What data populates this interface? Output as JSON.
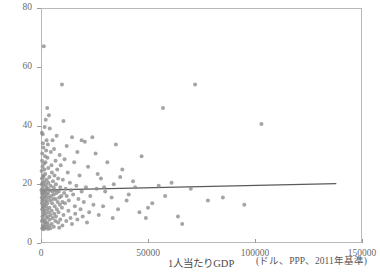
{
  "chart_data": {
    "type": "scatter",
    "title": "",
    "xlabel": "1人当たりGDP",
    "xunit": "(ドル、PPP、2011年基準)",
    "ylabel": "",
    "xlim": [
      0,
      150000
    ],
    "ylim": [
      0,
      80
    ],
    "xticks": [
      0,
      50000,
      100000,
      150000
    ],
    "xticklabels": [
      "0",
      "50000",
      "100000",
      "150000"
    ],
    "yticks": [
      0,
      20,
      40,
      60,
      80
    ],
    "yticklabels": [
      "0",
      "20",
      "40",
      "60",
      "80"
    ],
    "grid": false,
    "legend": null,
    "marker_color": "#8c8c8c",
    "marker_size": 4,
    "fit_line": {
      "type": "linear",
      "color": "#5a5a5a",
      "x_start": 0,
      "y_start": 18.0,
      "x_end": 138000,
      "y_end": 20.2
    },
    "points": [
      [
        1300,
        67.0
      ],
      [
        9800,
        54.0
      ],
      [
        72000,
        54.0
      ],
      [
        2900,
        46.0
      ],
      [
        57000,
        46.0
      ],
      [
        103000,
        40.5
      ],
      [
        3700,
        43.5
      ],
      [
        2200,
        42.0
      ],
      [
        10500,
        41.5
      ],
      [
        1700,
        39.5
      ],
      [
        4100,
        39.0
      ],
      [
        400,
        37.5
      ],
      [
        800,
        37.0
      ],
      [
        7300,
        36.5
      ],
      [
        14500,
        36.0
      ],
      [
        2600,
        35.0
      ],
      [
        5400,
        35.0
      ],
      [
        900,
        34.0
      ],
      [
        3200,
        33.5
      ],
      [
        20500,
        34.5
      ],
      [
        12000,
        33.0
      ],
      [
        1100,
        32.5
      ],
      [
        6100,
        32.0
      ],
      [
        2400,
        31.5
      ],
      [
        35000,
        33.5
      ],
      [
        4600,
        31.0
      ],
      [
        17000,
        31.0
      ],
      [
        600,
        30.5
      ],
      [
        8700,
        30.0
      ],
      [
        1900,
        29.5
      ],
      [
        25500,
        30.5
      ],
      [
        3000,
        29.0
      ],
      [
        11000,
        28.5
      ],
      [
        500,
        28.0
      ],
      [
        6800,
        28.0
      ],
      [
        2100,
        27.5
      ],
      [
        15500,
        27.5
      ],
      [
        1400,
        27.0
      ],
      [
        4900,
        26.5
      ],
      [
        9200,
        26.5
      ],
      [
        700,
        26.0
      ],
      [
        3400,
        25.5
      ],
      [
        22000,
        26.0
      ],
      [
        1600,
        25.0
      ],
      [
        7600,
        25.0
      ],
      [
        300,
        24.5
      ],
      [
        5100,
        24.0
      ],
      [
        12500,
        24.0
      ],
      [
        2000,
        23.5
      ],
      [
        38000,
        25.0
      ],
      [
        950,
        23.0
      ],
      [
        6300,
        23.0
      ],
      [
        18000,
        23.0
      ],
      [
        1200,
        22.5
      ],
      [
        3900,
        22.5
      ],
      [
        8000,
        22.0
      ],
      [
        450,
        22.0
      ],
      [
        2700,
        21.5
      ],
      [
        10200,
        21.5
      ],
      [
        1500,
        21.0
      ],
      [
        5600,
        21.0
      ],
      [
        28000,
        22.0
      ],
      [
        800,
        20.5
      ],
      [
        3500,
        20.5
      ],
      [
        13500,
        20.5
      ],
      [
        2300,
        20.0
      ],
      [
        7000,
        20.0
      ],
      [
        350,
        20.0
      ],
      [
        4400,
        19.5
      ],
      [
        16500,
        19.5
      ],
      [
        1050,
        19.5
      ],
      [
        9000,
        19.0
      ],
      [
        2500,
        19.0
      ],
      [
        5900,
        19.0
      ],
      [
        21000,
        19.0
      ],
      [
        600,
        18.5
      ],
      [
        3100,
        18.5
      ],
      [
        11500,
        18.5
      ],
      [
        1800,
        18.0
      ],
      [
        6600,
        18.0
      ],
      [
        250,
        18.0
      ],
      [
        4200,
        18.0
      ],
      [
        14000,
        18.0
      ],
      [
        26000,
        18.5
      ],
      [
        900,
        17.5
      ],
      [
        8300,
        17.5
      ],
      [
        2000,
        17.5
      ],
      [
        5300,
        17.5
      ],
      [
        19000,
        17.5
      ],
      [
        44000,
        19.0
      ],
      [
        500,
        17.0
      ],
      [
        3300,
        17.0
      ],
      [
        10800,
        17.0
      ],
      [
        1400,
        17.0
      ],
      [
        7200,
        17.0
      ],
      [
        30000,
        17.5
      ],
      [
        2800,
        16.5
      ],
      [
        6000,
        16.5
      ],
      [
        15000,
        16.5
      ],
      [
        700,
        16.5
      ],
      [
        4700,
        16.0
      ],
      [
        12000,
        16.0
      ],
      [
        1700,
        16.0
      ],
      [
        9500,
        16.0
      ],
      [
        23000,
        16.0
      ],
      [
        350,
        15.5
      ],
      [
        3700,
        15.5
      ],
      [
        8600,
        15.5
      ],
      [
        2200,
        15.5
      ],
      [
        5700,
        15.0
      ],
      [
        17500,
        15.0
      ],
      [
        1000,
        15.0
      ],
      [
        6900,
        15.0
      ],
      [
        33000,
        15.5
      ],
      [
        2600,
        14.5
      ],
      [
        4300,
        14.5
      ],
      [
        13000,
        14.5
      ],
      [
        600,
        14.5
      ],
      [
        10000,
        14.0
      ],
      [
        1900,
        14.0
      ],
      [
        7800,
        14.0
      ],
      [
        20000,
        14.0
      ],
      [
        40000,
        14.5
      ],
      [
        450,
        13.5
      ],
      [
        3000,
        13.5
      ],
      [
        5200,
        13.5
      ],
      [
        11200,
        13.5
      ],
      [
        1500,
        13.0
      ],
      [
        8800,
        13.0
      ],
      [
        24500,
        13.0
      ],
      [
        2400,
        12.5
      ],
      [
        6400,
        12.5
      ],
      [
        15800,
        12.5
      ],
      [
        800,
        12.5
      ],
      [
        4000,
        12.0
      ],
      [
        9800,
        12.0
      ],
      [
        1200,
        12.0
      ],
      [
        29000,
        12.5
      ],
      [
        52000,
        13.5
      ],
      [
        2900,
        11.5
      ],
      [
        7400,
        11.5
      ],
      [
        18500,
        11.5
      ],
      [
        550,
        11.5
      ],
      [
        5000,
        11.0
      ],
      [
        12800,
        11.0
      ],
      [
        1700,
        11.0
      ],
      [
        36000,
        11.5
      ],
      [
        3500,
        10.5
      ],
      [
        8200,
        10.5
      ],
      [
        22500,
        10.5
      ],
      [
        950,
        10.5
      ],
      [
        6200,
        10.0
      ],
      [
        16000,
        10.0
      ],
      [
        2100,
        10.0
      ],
      [
        46000,
        10.5
      ],
      [
        4500,
        9.5
      ],
      [
        10500,
        9.5
      ],
      [
        1300,
        9.5
      ],
      [
        27000,
        9.5
      ],
      [
        64000,
        9.0
      ],
      [
        3200,
        9.0
      ],
      [
        7000,
        9.0
      ],
      [
        19500,
        9.0
      ],
      [
        700,
        9.0
      ],
      [
        5500,
        8.5
      ],
      [
        13800,
        8.5
      ],
      [
        2500,
        8.5
      ],
      [
        33500,
        8.5
      ],
      [
        1000,
        8.0
      ],
      [
        9000,
        8.0
      ],
      [
        4100,
        8.0
      ],
      [
        17000,
        8.0
      ],
      [
        1800,
        7.5
      ],
      [
        6700,
        7.5
      ],
      [
        11800,
        7.5
      ],
      [
        400,
        7.5
      ],
      [
        3000,
        7.0
      ],
      [
        8000,
        7.0
      ],
      [
        21500,
        7.0
      ],
      [
        1500,
        7.0
      ],
      [
        5000,
        6.5
      ],
      [
        14500,
        6.5
      ],
      [
        2300,
        6.5
      ],
      [
        900,
        6.0
      ],
      [
        3800,
        6.0
      ],
      [
        10000,
        6.0
      ],
      [
        1200,
        5.5
      ],
      [
        6000,
        5.5
      ],
      [
        2700,
        5.5
      ],
      [
        600,
        5.0
      ],
      [
        4400,
        5.0
      ],
      [
        1900,
        5.0
      ],
      [
        8500,
        5.2
      ],
      [
        3300,
        4.8
      ],
      [
        1100,
        4.7
      ],
      [
        49000,
        8.5
      ],
      [
        41000,
        16.5
      ],
      [
        58000,
        16.0
      ],
      [
        85000,
        15.5
      ],
      [
        47000,
        29.5
      ],
      [
        31000,
        27.5
      ],
      [
        37000,
        22.5
      ],
      [
        43000,
        21.0
      ],
      [
        26500,
        23.5
      ],
      [
        34000,
        20.0
      ],
      [
        61000,
        20.5
      ],
      [
        70000,
        18.5
      ],
      [
        55000,
        19.5
      ],
      [
        50000,
        12.0
      ],
      [
        66000,
        6.5
      ],
      [
        78000,
        14.5
      ],
      [
        95000,
        13.0
      ],
      [
        24000,
        36.0
      ],
      [
        29500,
        19.0
      ],
      [
        19000,
        35.0
      ]
    ]
  }
}
